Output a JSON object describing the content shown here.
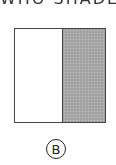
{
  "diagram": {
    "top_text_partial": "WHO SHADED",
    "shape": {
      "type": "square",
      "parts": 2,
      "shaded_parts": 1,
      "shaded_side": "right",
      "shade_color": "#a6a6a6",
      "unshaded_color": "#ffffff",
      "border_color": "#444444"
    },
    "option_label": "B"
  }
}
